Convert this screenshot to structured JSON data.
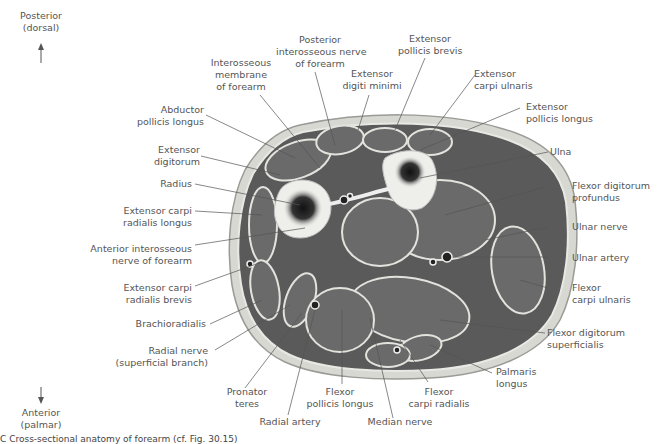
{
  "orientation": {
    "top": "Posterior\n(dorsal)",
    "bottom": "Anterior\n(palmar)"
  },
  "labels": {
    "posterior_interosseous_nerve": "Posterior\ninterosseous nerve\nof forearm",
    "extensor_pollicis_brevis": "Extensor\npollicis brevis",
    "interosseous_membrane": "Interosseous\nmembrane\nof forearm",
    "extensor_digiti_minimi": "Extensor\ndigiti minimi",
    "extensor_carpi_ulnaris": "Extensor\ncarpi ulnaris",
    "abductor_pollicis_longus": "Abductor\npollicis longus",
    "extensor_pollicis_longus": "Extensor\npollicis longus",
    "extensor_digitorum": "Extensor\ndigitorum",
    "ulna": "Ulna",
    "radius": "Radius",
    "flexor_digitorum_profundus": "Flexor digitorum\nprofundus",
    "extensor_carpi_radialis_longus": "Extensor carpi\nradialis longus",
    "anterior_interosseous_nerve": "Anterior interosseous\nnerve of forearm",
    "ulnar_nerve": "Ulnar nerve",
    "ulnar_artery": "Ulnar artery",
    "extensor_carpi_radialis_brevis": "Extensor carpi\nradialis brevis",
    "flexor_carpi_ulnaris": "Flexor\ncarpi ulnaris",
    "brachioradialis": "Brachioradialis",
    "flexor_digitorum_superficialis": "Flexor digitorum\nsuperficialis",
    "radial_nerve_superficial": "Radial nerve\n(superficial branch)",
    "palmaris_longus": "Palmaris\nlongus",
    "pronator_teres": "Pronator\nteres",
    "flexor_pollicis_longus": "Flexor\npollicis longus",
    "flexor_carpi_radialis": "Flexor\ncarpi radialis",
    "radial_artery": "Radial artery",
    "median_nerve": "Median nerve"
  },
  "caption": "C  Cross-sectional anatomy of forearm (cf. Fig. 30.15)"
}
